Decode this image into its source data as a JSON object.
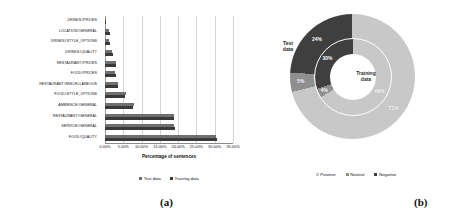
{
  "figure": {
    "caption_a": "(a)",
    "caption_b": "(b)"
  },
  "chart_data": [
    {
      "type": "bar",
      "orientation": "horizontal",
      "title": "",
      "xlabel": "Percentage of sentences",
      "ylabel": "",
      "xlim": [
        0,
        35
      ],
      "xticks": [
        "0.00%",
        "5.00%",
        "10.00%",
        "15.00%",
        "20.00%",
        "25.00%",
        "30.00%",
        "35.00%"
      ],
      "xtick_values": [
        0,
        5,
        10,
        15,
        20,
        25,
        30,
        35
      ],
      "grid": true,
      "legend_position": "bottom",
      "categories": [
        "DRINKS#PRICES",
        "LOCATION#GENERAL",
        "DRINKS#STYLE_OPTIONS",
        "DRINKS#QUALITY",
        "RESTAURANT#PRICES",
        "FOOD#PRICES",
        "RESTAURANT#MISCELLANEOUS",
        "FOOD#STYLE_OPTIONS",
        "AMBIENCE#GENERAL",
        "RESTAURANT#GENERAL",
        "SERVICE#GENERAL",
        "FOOD#QUALITY"
      ],
      "series": [
        {
          "name": "Test data",
          "color": "#6f6f6f",
          "values": [
            0.3,
            1.1,
            1.2,
            1.9,
            2.9,
            2.8,
            3.6,
            5.8,
            7.8,
            18.8,
            19.0,
            30.4
          ]
        },
        {
          "name": "Training data",
          "color": "#3a3a3a",
          "values": [
            0.4,
            1.3,
            1.4,
            2.1,
            2.9,
            2.9,
            3.6,
            5.6,
            7.6,
            18.9,
            19.1,
            30.6
          ]
        }
      ]
    },
    {
      "type": "pie",
      "subtype": "nested-donut",
      "title": "",
      "legend_position": "bottom",
      "legend": [
        "Positive",
        "Neutral",
        "Negative"
      ],
      "colors": {
        "positive": "#c8c8c8",
        "neutral": "#8f8f8f",
        "negative": "#3f3f3f"
      },
      "rings": [
        {
          "name": "Test data",
          "ring": "outer",
          "labels": [
            "Positive",
            "Neutral",
            "Negative"
          ],
          "values": [
            71,
            5,
            24
          ],
          "value_labels": [
            "71%",
            "5%",
            "24%"
          ]
        },
        {
          "name": "Training data",
          "ring": "inner",
          "labels": [
            "Positive",
            "Neutral",
            "Negative"
          ],
          "values": [
            66,
            4,
            30
          ],
          "value_labels": [
            "66%",
            "4%",
            "30%"
          ]
        }
      ]
    }
  ],
  "panel_a": {
    "axis_title": "Percentage of sentences",
    "xticks": [
      "0.00%",
      "5.00%",
      "10.00%",
      "15.00%",
      "20.00%",
      "25.00%",
      "30.00%",
      "35.00%"
    ],
    "categories": [
      "DRINKS#PRICES",
      "LOCATION#GENERAL",
      "DRINKS#STYLE_OPTIONS",
      "DRINKS#QUALITY",
      "RESTAURANT#PRICES",
      "FOOD#PRICES",
      "RESTAURANT#MISCELLANEOUS",
      "FOOD#STYLE_OPTIONS",
      "AMBIENCE#GENERAL",
      "RESTAURANT#GENERAL",
      "SERVICE#GENERAL",
      "FOOD#QUALITY"
    ],
    "legend": [
      {
        "label": "Test data",
        "color": "#6f6f6f"
      },
      {
        "label": "Training data",
        "color": "#3a3a3a"
      }
    ]
  },
  "panel_b": {
    "outer_ring_name": "Test\ndata",
    "inner_ring_name": "Training\ndata",
    "outer_labels": [
      "71%",
      "5%",
      "24%"
    ],
    "inner_labels": [
      "66%",
      "4%",
      "30%"
    ],
    "legend": [
      {
        "label": "Positive",
        "color": "#c8c8c8"
      },
      {
        "label": "Neutral",
        "color": "#8f8f8f"
      },
      {
        "label": "Negative",
        "color": "#3f3f3f"
      }
    ]
  }
}
